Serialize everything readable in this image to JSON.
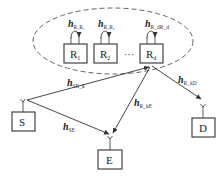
{
  "diagram": {
    "cluster": {
      "style": "dashed-ellipse",
      "color": "#555555"
    },
    "relays": [
      {
        "id": "R1",
        "label": "R",
        "sub": "1",
        "self_channel": {
          "main": "h",
          "sub": "R₁R₁"
        }
      },
      {
        "id": "R2",
        "label": "R",
        "sub": "2",
        "self_channel": {
          "main": "h",
          "sub": "R₂R₂"
        }
      },
      {
        "id": "Rd",
        "label": "R",
        "sub": "d",
        "self_channel": {
          "main": "h",
          "sub": "R_dR_d"
        }
      }
    ],
    "ellipsis": "···",
    "nodes": {
      "source": {
        "label": "S"
      },
      "eavesdropper": {
        "label": "E"
      },
      "destination": {
        "label": "D"
      }
    },
    "channels": {
      "sr": {
        "main": "h",
        "sub": "SR_k"
      },
      "se": {
        "main": "h",
        "sub": "SE"
      },
      "re": {
        "main": "h",
        "sub": "R_kE"
      },
      "rd": {
        "main": "h",
        "sub": "R_kD"
      }
    },
    "line_color": "#333333"
  }
}
